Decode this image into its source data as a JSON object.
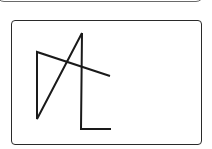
{
  "figure": {
    "stroke_color": "#1a1a1a",
    "frame_color": "#2a2a2a",
    "strokes": [
      {
        "name": "left-triangle-stroke",
        "points": "82,33 37,119 37,52 110,76"
      },
      {
        "name": "vertical-l-stroke",
        "points": "82,33 81,129 111,129"
      }
    ]
  }
}
